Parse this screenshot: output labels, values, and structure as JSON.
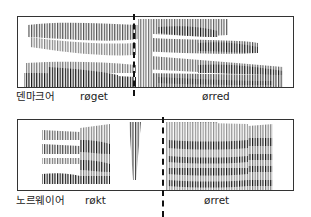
{
  "figure": {
    "type": "spectrogram-comparison",
    "panels": [
      {
        "language": "덴마크어",
        "words": [
          {
            "text": "røget",
            "position": "left"
          },
          {
            "text": "ørred",
            "position": "right"
          }
        ]
      },
      {
        "language": "노르웨이어",
        "words": [
          {
            "text": "røkt",
            "position": "left"
          },
          {
            "text": "ørret",
            "position": "right"
          }
        ]
      }
    ],
    "colors": {
      "ink": "#111111",
      "border": "#333333",
      "background": "#ffffff"
    }
  }
}
